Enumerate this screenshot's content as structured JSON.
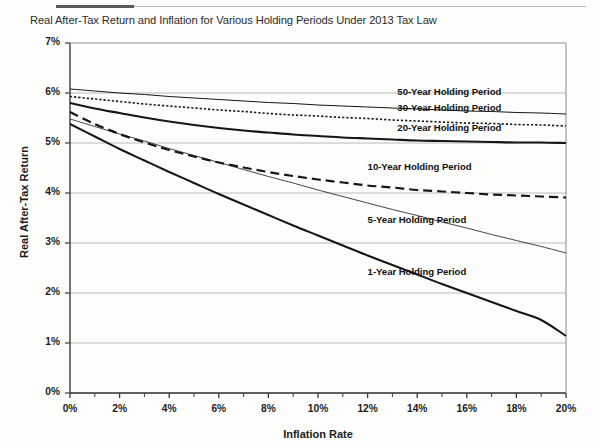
{
  "chart_data": {
    "type": "line",
    "title": "Real After-Tax Return and Inflation for Various Holding Periods Under 2013 Tax Law",
    "xlabel": "Inflation Rate",
    "ylabel": "Real After-Tax Return",
    "xlim": [
      0,
      20
    ],
    "ylim": [
      0,
      7
    ],
    "xtick_labels": [
      "0%",
      "2%",
      "4%",
      "6%",
      "8%",
      "10%",
      "12%",
      "14%",
      "16%",
      "18%",
      "20%"
    ],
    "xtick_values": [
      0,
      2,
      4,
      6,
      8,
      10,
      12,
      14,
      16,
      18,
      20
    ],
    "xminor_step": 1,
    "ytick_labels": [
      "0%",
      "1%",
      "2%",
      "3%",
      "4%",
      "5%",
      "6%",
      "7%"
    ],
    "ytick_values": [
      0,
      1,
      2,
      3,
      4,
      5,
      6,
      7
    ],
    "grid": "horizontal",
    "legend": "inline-labels",
    "x": [
      0,
      1,
      2,
      3,
      4,
      5,
      6,
      7,
      8,
      9,
      10,
      11,
      12,
      13,
      14,
      15,
      16,
      17,
      18,
      19,
      20
    ],
    "series": [
      {
        "name": "50-Year Holding Period",
        "style": "solid-thin",
        "label_x": 13.2,
        "label_y": 6.02,
        "values": [
          6.08,
          6.04,
          6.0,
          5.97,
          5.93,
          5.9,
          5.87,
          5.84,
          5.81,
          5.79,
          5.76,
          5.74,
          5.72,
          5.7,
          5.68,
          5.66,
          5.64,
          5.63,
          5.61,
          5.6,
          5.58
        ]
      },
      {
        "name": "30-Year Holding Period",
        "style": "dotted",
        "label_x": 13.2,
        "label_y": 5.7,
        "values": [
          5.93,
          5.88,
          5.83,
          5.78,
          5.74,
          5.7,
          5.66,
          5.63,
          5.59,
          5.56,
          5.54,
          5.51,
          5.49,
          5.46,
          5.44,
          5.42,
          5.4,
          5.39,
          5.37,
          5.36,
          5.34
        ]
      },
      {
        "name": "20-Year Holding Period",
        "style": "solid-thick",
        "label_x": 13.2,
        "label_y": 5.3,
        "values": [
          5.8,
          5.69,
          5.6,
          5.51,
          5.43,
          5.36,
          5.3,
          5.25,
          5.21,
          5.17,
          5.14,
          5.11,
          5.09,
          5.07,
          5.05,
          5.04,
          5.03,
          5.02,
          5.01,
          5.01,
          5.0
        ]
      },
      {
        "name": "10-Year Holding Period",
        "style": "dashed",
        "label_x": 12.0,
        "label_y": 4.52,
        "values": [
          5.62,
          5.38,
          5.18,
          5.01,
          4.86,
          4.73,
          4.61,
          4.51,
          4.42,
          4.34,
          4.27,
          4.21,
          4.15,
          4.11,
          4.06,
          4.03,
          4.0,
          3.97,
          3.95,
          3.93,
          3.91
        ]
      },
      {
        "name": "5-Year Holding Period",
        "style": "solid-hairline",
        "label_x": 12.0,
        "label_y": 3.46,
        "values": [
          5.48,
          5.33,
          5.18,
          5.04,
          4.89,
          4.75,
          4.61,
          4.47,
          4.33,
          4.2,
          4.06,
          3.93,
          3.8,
          3.67,
          3.55,
          3.42,
          3.3,
          3.17,
          3.05,
          2.93,
          2.8
        ]
      },
      {
        "name": "1-Year Holding Period",
        "style": "solid-medium",
        "label_x": 12.0,
        "label_y": 2.42,
        "values": [
          5.38,
          5.13,
          4.88,
          4.65,
          4.42,
          4.2,
          3.98,
          3.77,
          3.56,
          3.35,
          3.15,
          2.95,
          2.75,
          2.56,
          2.37,
          2.18,
          2.0,
          1.82,
          1.64,
          1.46,
          1.14
        ]
      }
    ]
  }
}
